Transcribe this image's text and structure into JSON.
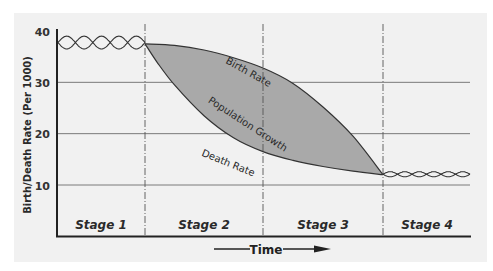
{
  "chart_data": {
    "type": "line",
    "title": "",
    "xlabel": "Time",
    "ylabel": "Birth/Death Rate (Per 1000)",
    "ylim": [
      0,
      40
    ],
    "yticks": [
      10,
      20,
      30,
      40
    ],
    "grid": {
      "horizontal": true,
      "lines_at": [
        10,
        20,
        30
      ]
    },
    "legend": "none",
    "stages": [
      "Stage 1",
      "Stage 2",
      "Stage 3",
      "Stage 4"
    ],
    "x_stage_boundaries": [
      0,
      1,
      2,
      3,
      4
    ],
    "series": [
      {
        "name": "Birth Rate",
        "x": [
          0,
          0.5,
          1.0,
          1.25,
          1.5,
          1.75,
          2.0,
          2.25,
          2.5,
          2.75,
          3.0,
          3.5,
          4.0
        ],
        "values": [
          38,
          38,
          37.5,
          37.2,
          36.3,
          34.8,
          32.8,
          29.8,
          25.2,
          19.5,
          12,
          12,
          12
        ]
      },
      {
        "name": "Death Rate",
        "x": [
          0,
          0.5,
          1.0,
          1.1,
          1.25,
          1.5,
          1.75,
          2.0,
          2.25,
          2.5,
          2.75,
          3.0,
          3.5,
          4.0
        ],
        "values": [
          38,
          38,
          37.5,
          34,
          29.5,
          23.5,
          19.2,
          16.5,
          14.8,
          13.6,
          12.7,
          12,
          12,
          12
        ]
      }
    ],
    "annotations": [
      {
        "text": "Birth Rate",
        "note": "label along upper curve in Stage 2-3"
      },
      {
        "text": "Population Growth",
        "note": "shaded area between birth and death rate curves"
      },
      {
        "text": "Death Rate",
        "note": "label along lower curve in Stage 2-3"
      }
    ],
    "stage1_oscillation": {
      "min": 36.5,
      "max": 39,
      "note": "birth and death rates fluctuate and cross"
    },
    "stage4_oscillation": {
      "min": 11.5,
      "max": 12.5,
      "note": "birth and death rates fluctuate and cross"
    }
  },
  "labels": {
    "ylabel": "Birth/Death Rate (Per 1000)",
    "xlabel": "Time",
    "yticks": [
      "40",
      "30",
      "20",
      "10"
    ],
    "stages": [
      "Stage 1",
      "Stage 2",
      "Stage 3",
      "Stage 4"
    ],
    "birth_rate": "Birth Rate",
    "death_rate": "Death Rate",
    "population_growth": "Population Growth"
  },
  "colors": {
    "panel_bg": "#f1f1f1",
    "fill": "#a9a9a9",
    "line": "#333333",
    "grid": "#7a7a7a",
    "axis": "#222222"
  }
}
